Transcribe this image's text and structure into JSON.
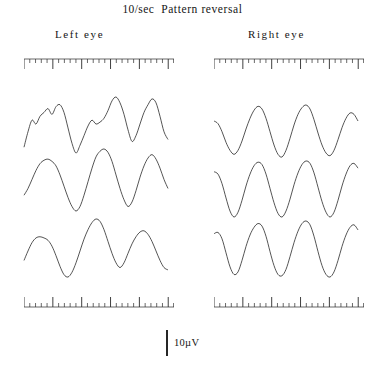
{
  "title": {
    "rate": "10/sec",
    "condition": "Pattern reversal",
    "full": "10/sec  Pattern reversal"
  },
  "columns": {
    "left_label": "Left  eye",
    "right_label": "Right  eye"
  },
  "calibration": {
    "label": "10µV",
    "value": 10,
    "unit": "µV"
  },
  "chart_data": {
    "type": "line",
    "subtitle": "",
    "xlabel": "",
    "ylabel": "",
    "grid": false,
    "legend_position": "none",
    "calibration_uv": 10,
    "stimulus_rate_hz": 10,
    "axis_ticks": {
      "minor_per_major": 5,
      "minor_count": 26,
      "major_count": 6
    },
    "panels": [
      {
        "eye": "Left  eye",
        "traces": [
          {
            "name": "left-trace-1",
            "x": [
              0,
              4,
              8,
              12,
              16,
              20,
              24,
              28,
              32,
              36,
              40,
              44,
              48,
              52,
              56,
              60,
              64,
              68,
              72,
              76,
              80,
              84,
              88,
              92,
              96,
              100,
              104,
              108,
              112,
              116,
              120,
              124,
              128,
              132,
              136,
              140,
              144
            ],
            "y": [
              30,
              22,
              16,
              18,
              14,
              12,
              10,
              13,
              9,
              8,
              12,
              20,
              28,
              33,
              29,
              24,
              19,
              16,
              18,
              17,
              15,
              11,
              6,
              4,
              7,
              13,
              21,
              27,
              24,
              18,
              12,
              8,
              5,
              7,
              14,
              22,
              26
            ]
          },
          {
            "name": "left-trace-2",
            "x": [
              0,
              4,
              8,
              12,
              16,
              20,
              24,
              28,
              32,
              36,
              40,
              44,
              48,
              52,
              56,
              60,
              64,
              68,
              72,
              76,
              80,
              84,
              88,
              92,
              96,
              100,
              104,
              108,
              112,
              116,
              120,
              124,
              128,
              132,
              136,
              140,
              144
            ],
            "y": [
              44,
              38,
              30,
              22,
              16,
              13,
              12,
              14,
              18,
              26,
              36,
              46,
              54,
              58,
              54,
              44,
              32,
              20,
              10,
              5,
              3,
              6,
              14,
              26,
              38,
              48,
              54,
              50,
              40,
              28,
              18,
              11,
              8,
              12,
              20,
              30,
              38
            ]
          },
          {
            "name": "left-trace-3",
            "x": [
              0,
              4,
              8,
              12,
              16,
              20,
              24,
              28,
              32,
              36,
              40,
              44,
              48,
              52,
              56,
              60,
              64,
              68,
              72,
              76,
              80,
              84,
              88,
              92,
              96,
              100,
              104,
              108,
              112,
              116,
              120,
              124,
              128,
              132,
              136,
              140,
              144
            ],
            "y": [
              38,
              30,
              23,
              19,
              18,
              19,
              21,
              26,
              34,
              43,
              50,
              52,
              48,
              40,
              30,
              20,
              12,
              6,
              3,
              5,
              12,
              22,
              32,
              40,
              44,
              40,
              32,
              24,
              18,
              14,
              13,
              16,
              22,
              30,
              38,
              44,
              46
            ]
          }
        ]
      },
      {
        "eye": "Right  eye",
        "traces": [
          {
            "name": "right-trace-1",
            "x": [
              0,
              4,
              8,
              12,
              16,
              20,
              24,
              28,
              32,
              36,
              40,
              44,
              48,
              52,
              56,
              60,
              64,
              68,
              72,
              76,
              80,
              84,
              88,
              92,
              96,
              100,
              104,
              108,
              112,
              116,
              120,
              124,
              128,
              132,
              136,
              140,
              144
            ],
            "y": [
              18,
              20,
              26,
              34,
              40,
              43,
              40,
              33,
              24,
              16,
              10,
              7,
              9,
              16,
              26,
              36,
              43,
              45,
              40,
              31,
              21,
              13,
              8,
              6,
              9,
              17,
              27,
              36,
              42,
              44,
              40,
              32,
              23,
              16,
              12,
              13,
              18
            ]
          },
          {
            "name": "right-trace-2",
            "x": [
              0,
              4,
              8,
              12,
              16,
              20,
              24,
              28,
              32,
              36,
              40,
              44,
              48,
              52,
              56,
              60,
              64,
              68,
              72,
              76,
              80,
              84,
              88,
              92,
              96,
              100,
              104,
              108,
              112,
              116,
              120,
              124,
              128,
              132,
              136,
              140,
              144
            ],
            "y": [
              14,
              16,
              24,
              36,
              47,
              52,
              48,
              38,
              26,
              16,
              9,
              6,
              8,
              16,
              28,
              40,
              49,
              52,
              47,
              37,
              25,
              15,
              8,
              5,
              7,
              15,
              27,
              39,
              48,
              52,
              48,
              38,
              26,
              16,
              9,
              7,
              11
            ]
          },
          {
            "name": "right-trace-3",
            "x": [
              0,
              4,
              8,
              12,
              16,
              20,
              24,
              28,
              32,
              36,
              40,
              44,
              48,
              52,
              56,
              60,
              64,
              68,
              72,
              76,
              80,
              84,
              88,
              92,
              96,
              100,
              104,
              108,
              112,
              116,
              120,
              124,
              128,
              132,
              136,
              140,
              144
            ],
            "y": [
              16,
              15,
              20,
              31,
              42,
              48,
              46,
              37,
              26,
              17,
              11,
              8,
              10,
              18,
              30,
              41,
              48,
              49,
              44,
              34,
              23,
              14,
              8,
              6,
              9,
              18,
              30,
              41,
              48,
              50,
              46,
              37,
              26,
              17,
              11,
              9,
              13
            ]
          }
        ]
      }
    ]
  }
}
